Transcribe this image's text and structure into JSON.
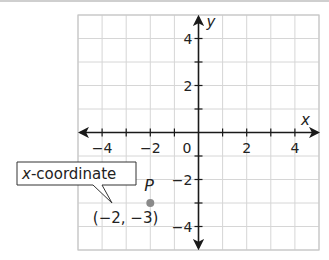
{
  "figure": {
    "x_axis_label": "x",
    "y_axis_label": "y",
    "origin_label": "0",
    "x_range": [
      -5,
      5
    ],
    "y_range": [
      -5,
      5
    ],
    "x_tick_labels": [
      {
        "value": -4,
        "label": "−4"
      },
      {
        "value": -2,
        "label": "−2"
      },
      {
        "value": 2,
        "label": "2"
      },
      {
        "value": 4,
        "label": "4"
      }
    ],
    "y_tick_labels": [
      {
        "value": 4,
        "label": "4"
      },
      {
        "value": 2,
        "label": "2"
      },
      {
        "value": -2,
        "label": "−2"
      },
      {
        "value": -4,
        "label": "−4"
      }
    ],
    "point": {
      "name": "P",
      "x": -2,
      "y": -3,
      "coordinates_label": "(−2, −3)",
      "color": "#8a8a8a"
    },
    "callout": {
      "italic_part": "x",
      "text_part": "-coordinate"
    },
    "colors": {
      "grid": "#d6d6d6",
      "axis": "#1a1a1a",
      "border": "#c8c8c8"
    }
  }
}
